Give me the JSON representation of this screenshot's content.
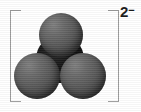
{
  "figure": {
    "kind": "space-filling-molecular-model",
    "charge_label": "2",
    "charge_sign": "−",
    "bracket_color": "#9a9a9a",
    "background_color": "#ffffff",
    "label_color": "#1a1a1a"
  },
  "molecule": {
    "name": "carbonate ion",
    "atoms": [
      {
        "id": "center",
        "element": "C",
        "role": "central-atom",
        "color": "#0d0d0d"
      },
      {
        "id": "top",
        "element": "O",
        "role": "terminal-atom",
        "color": "#5a5a5a"
      },
      {
        "id": "left",
        "element": "O",
        "role": "terminal-atom",
        "color": "#5a5a5a"
      },
      {
        "id": "right",
        "element": "O",
        "role": "terminal-atom",
        "color": "#5a5a5a"
      }
    ]
  }
}
